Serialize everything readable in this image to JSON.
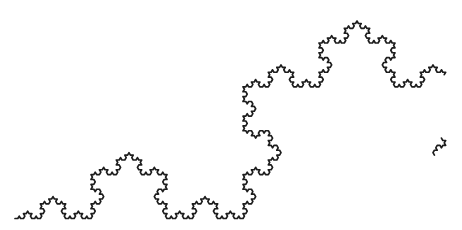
{
  "canvas": {
    "width": 462,
    "height": 230,
    "background": "#ffffff"
  },
  "figure": {
    "type": "koch-curve",
    "iterations": 5,
    "bump_angle_deg": 60,
    "start": [
      15,
      218.5
    ],
    "end": [
      699,
      218.5
    ],
    "stroke_color": "#1d1d1d",
    "stroke_width": 1.7,
    "drawn_ranges": [
      [
        0,
        0.6025
      ],
      [
        0.6755,
        0.6885
      ]
    ],
    "landmarks": {
      "left_start_point": [
        15,
        218
      ],
      "mid_level_peak": [
        129,
        153
      ],
      "main_peak_apex": [
        357,
        18
      ],
      "stroke_end_point": [
        444,
        67
      ],
      "fragment_top": [
        440,
        137
      ],
      "fragment_bottom": [
        438,
        158
      ]
    }
  }
}
